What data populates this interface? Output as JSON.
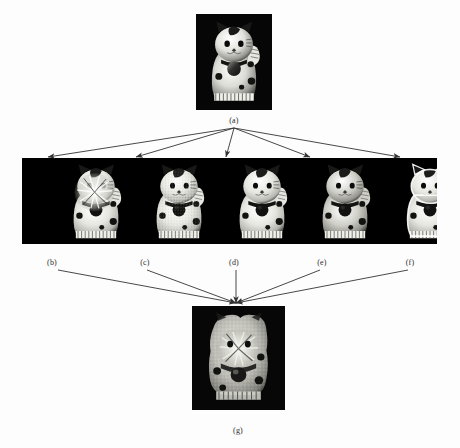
{
  "figure": {
    "type": "multi-view-image-fusion-diagram",
    "background_color": "#ffffff",
    "panel_background_color": "#000000",
    "arrow_color": "#333333",
    "label_color": "#2b2b2b"
  },
  "source": {
    "label": "(a)",
    "name": "source-image",
    "x": 196,
    "y": 14,
    "w": 76,
    "h": 96,
    "label_x": 234,
    "label_y": 116
  },
  "filmstrip": {
    "name": "multi-view-strip",
    "x": 22,
    "y": 158,
    "w": 415,
    "h": 86,
    "frames": [
      {
        "label": "(b)",
        "label_x": 52,
        "label_y": 258,
        "variant": "highlight-burst",
        "cx": 60,
        "w": 72,
        "h": 82
      },
      {
        "label": "(c)",
        "label_x": 145,
        "label_y": 258,
        "variant": "speckle",
        "cx": 143,
        "w": 72,
        "h": 82
      },
      {
        "label": "(d)",
        "label_x": 234,
        "label_y": 258,
        "variant": "plain",
        "cx": 226,
        "w": 72,
        "h": 82
      },
      {
        "label": "(e)",
        "label_x": 322,
        "label_y": 258,
        "variant": "plain-dark",
        "cx": 309,
        "w": 72,
        "h": 82
      },
      {
        "label": "(f)",
        "label_x": 410,
        "label_y": 258,
        "variant": "outlined",
        "cx": 394,
        "w": 72,
        "h": 82
      }
    ]
  },
  "result": {
    "label": "(g)",
    "name": "fused-result-image",
    "x": 192,
    "y": 306,
    "w": 93,
    "h": 104,
    "label_x": 238,
    "label_y": 426
  },
  "arrows": {
    "fan_out": {
      "name": "fan-out-arrows",
      "origin_x": 234,
      "origin_y": 128,
      "targets": [
        {
          "x": 48,
          "y": 157
        },
        {
          "x": 136,
          "y": 157
        },
        {
          "x": 226,
          "y": 157
        },
        {
          "x": 310,
          "y": 157
        },
        {
          "x": 400,
          "y": 157
        }
      ]
    },
    "fan_in": {
      "name": "fan-in-arrows",
      "target_x": 236,
      "target_y": 303,
      "origins": [
        {
          "x": 58,
          "y": 270
        },
        {
          "x": 147,
          "y": 270
        },
        {
          "x": 236,
          "y": 270
        },
        {
          "x": 320,
          "y": 270
        },
        {
          "x": 408,
          "y": 270
        }
      ]
    }
  }
}
